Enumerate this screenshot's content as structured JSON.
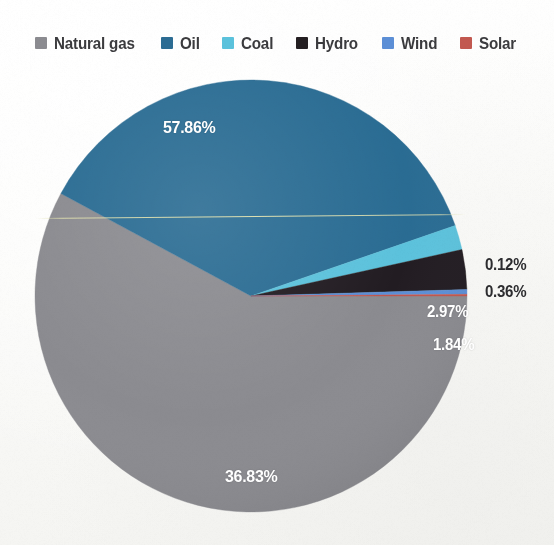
{
  "legend": {
    "items": [
      {
        "label": "Natural gas",
        "color": "#8b8b90",
        "swatch_name": "legend-swatch-natural-gas"
      },
      {
        "label": "Oil",
        "color": "#2c6c93",
        "swatch_name": "legend-swatch-oil"
      },
      {
        "label": "Coal",
        "color": "#5bc2dc",
        "swatch_name": "legend-swatch-coal"
      },
      {
        "label": "Hydro",
        "color": "#241f22",
        "swatch_name": "legend-swatch-hydro"
      },
      {
        "label": "Wind",
        "color": "#5c8fd6",
        "swatch_name": "legend-swatch-wind"
      },
      {
        "label": "Solar",
        "color": "#c2584f",
        "swatch_name": "legend-swatch-solar"
      }
    ]
  },
  "labels": {
    "natural_gas": "57.86%",
    "oil": "36.83%",
    "coal": "1.84%",
    "hydro": "2.97%",
    "wind": "0.36%",
    "solar": "0.12%"
  },
  "chart_data": {
    "type": "pie",
    "title": "",
    "subtitle": "",
    "xlabel": "",
    "ylabel": "",
    "grid": false,
    "legend_position": "top",
    "units": "percent",
    "start_angle_deg": 0,
    "direction": "clockwise",
    "categories": [
      "Natural gas",
      "Oil",
      "Coal",
      "Hydro",
      "Wind",
      "Solar"
    ],
    "values": [
      57.86,
      36.83,
      1.84,
      2.97,
      0.36,
      0.12
    ],
    "colors": [
      "#8b8b90",
      "#2c6c93",
      "#5bc2dc",
      "#241f22",
      "#5c8fd6",
      "#c2584f"
    ],
    "data_labels": [
      "57.86%",
      "36.83%",
      "1.84%",
      "2.97%",
      "0.36%",
      "0.12%"
    ],
    "slices": [
      {
        "name": "Natural gas",
        "value": 57.86,
        "label": "57.86%",
        "color": "#8b8b90",
        "label_placement": "inside"
      },
      {
        "name": "Oil",
        "value": 36.83,
        "label": "36.83%",
        "color": "#2c6c93",
        "label_placement": "inside"
      },
      {
        "name": "Coal",
        "value": 1.84,
        "label": "1.84%",
        "color": "#5bc2dc",
        "label_placement": "inside"
      },
      {
        "name": "Hydro",
        "value": 2.97,
        "label": "2.97%",
        "color": "#241f22",
        "label_placement": "inside"
      },
      {
        "name": "Wind",
        "value": 0.36,
        "label": "0.36%",
        "color": "#5c8fd6",
        "label_placement": "outside"
      },
      {
        "name": "Solar",
        "value": 0.12,
        "label": "0.12%",
        "color": "#c2584f",
        "label_placement": "outside"
      }
    ],
    "total": 99.98
  }
}
